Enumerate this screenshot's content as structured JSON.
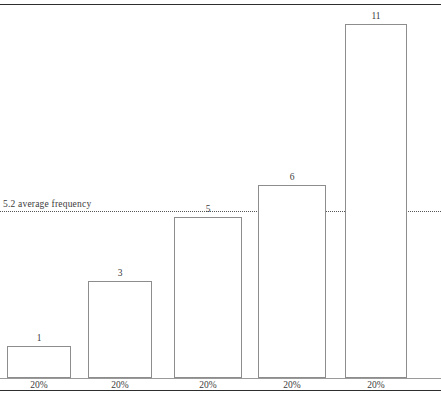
{
  "chart_data": {
    "type": "bar",
    "title": "",
    "xlabel": "",
    "ylabel": "",
    "categories": [
      "20%",
      "20%",
      "20%",
      "20%",
      "20%"
    ],
    "values": [
      1,
      3,
      5,
      6,
      11
    ],
    "value_labels": [
      "1",
      "3",
      "5",
      "6",
      "11"
    ],
    "ylim": [
      0,
      11.6
    ],
    "grid": false,
    "legend": null,
    "annotations": [
      {
        "type": "reference-line",
        "style": "dotted",
        "value": 5.2,
        "label": "5.2 average frequency"
      }
    ]
  },
  "axis": {
    "tick_labels": [
      "20%",
      "20%",
      "20%",
      "20%",
      "20%"
    ]
  },
  "reference_line": {
    "value": 5.2,
    "label": "5.2 average frequency"
  },
  "bars": [
    {
      "value": 1,
      "label": "1",
      "tick": "20%"
    },
    {
      "value": 3,
      "label": "3",
      "tick": "20%"
    },
    {
      "value": 5,
      "label": "5",
      "tick": "20%"
    },
    {
      "value": 6,
      "label": "6",
      "tick": "20%"
    },
    {
      "value": 11,
      "label": "11",
      "tick": "20%"
    }
  ],
  "top_caption": "",
  "colors": {
    "rule": "#2e2e2e",
    "bar_stroke": "#8d8d8d",
    "bar_fill": "#ffffff",
    "reference_line": "#555555",
    "text": "#3b3b3b"
  }
}
